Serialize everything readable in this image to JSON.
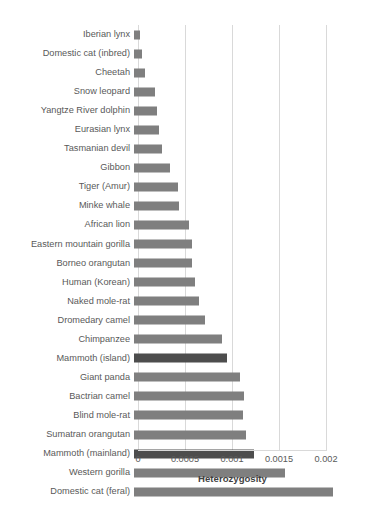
{
  "chart_data": {
    "type": "bar",
    "orientation": "horizontal",
    "title": "",
    "xlabel": "Heterozygosity",
    "ylabel": "",
    "xlim": [
      0,
      0.002
    ],
    "xticks": [
      "0",
      "0.0005",
      "0.001",
      "0.0015",
      "0.002"
    ],
    "xtick_values": [
      0,
      0.0005,
      0.001,
      0.0015,
      0.002
    ],
    "grid": true,
    "legend": "none",
    "series_name": "Heterozygosity",
    "bar_color": "#7f7f7f",
    "highlight_color": "#4d4d4d",
    "categories": [
      "Iberian lynx",
      "Domestic cat (inbred)",
      "Cheetah",
      "Snow leopard",
      "Yangtze River dolphin",
      "Eurasian lynx",
      "Tasmanian devil",
      "Gibbon",
      "Tiger (Amur)",
      "Minke whale",
      "African lion",
      "Eastern mountain gorilla",
      "Borneo orangutan",
      "Human (Korean)",
      "Naked mole-rat",
      "Dromedary camel",
      "Chimpanzee",
      "Mammoth (island)",
      "Giant panda",
      "Bactrian camel",
      "Blind mole-rat",
      "Sumatran orangutan",
      "Mammoth (mainland)",
      "Western gorilla",
      "Domestic cat (feral)"
    ],
    "values": [
      6.5e-05,
      8e-05,
      0.00012,
      0.00022,
      0.00024,
      0.00027,
      0.0003,
      0.00038,
      0.00047,
      0.00048,
      0.00059,
      0.00062,
      0.00062,
      0.00065,
      0.00069,
      0.00075,
      0.00094,
      0.00099,
      0.00113,
      0.00117,
      0.00116,
      0.00119,
      0.00128,
      0.00161,
      0.00212
    ],
    "highlighted": [
      "Mammoth (island)",
      "Mammoth (mainland)"
    ]
  }
}
